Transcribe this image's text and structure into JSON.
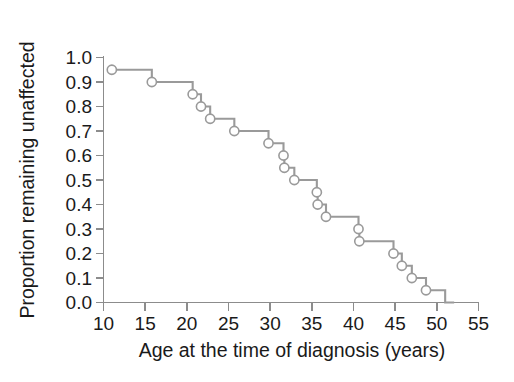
{
  "chart_data": {
    "type": "line",
    "subtype": "kaplan-meier-step",
    "title": "",
    "xlabel": "Age at the time of diagnosis (years)",
    "ylabel": "Proportion remaining unaffected",
    "xlim": [
      10,
      55
    ],
    "ylim": [
      0.0,
      1.0
    ],
    "grid": false,
    "legend": null,
    "xticks": [
      10,
      15,
      20,
      25,
      30,
      35,
      40,
      45,
      50,
      55
    ],
    "xtick_labels": [
      "10",
      "15",
      "20",
      "25",
      "30",
      "35",
      "40",
      "45",
      "50",
      "55"
    ],
    "yticks": [
      0.0,
      0.1,
      0.2,
      0.3,
      0.4,
      0.5,
      0.6,
      0.7,
      0.8,
      0.9,
      1.0
    ],
    "ytick_labels": [
      "0.0",
      "0.1",
      "0.2",
      "0.3",
      "0.4",
      "0.5",
      "0.6",
      "0.7",
      "0.8",
      "0.9",
      "1.0"
    ],
    "series": [
      {
        "name": "Proportion remaining unaffected",
        "color": "#9a9a9a",
        "marker": "open-circle",
        "marker_color": "#9a9a9a",
        "points": [
          {
            "x": 11.0,
            "y": 0.95
          },
          {
            "x": 15.8,
            "y": 0.9
          },
          {
            "x": 20.7,
            "y": 0.85
          },
          {
            "x": 21.7,
            "y": 0.8
          },
          {
            "x": 22.8,
            "y": 0.75
          },
          {
            "x": 25.7,
            "y": 0.7
          },
          {
            "x": 29.8,
            "y": 0.65
          },
          {
            "x": 31.6,
            "y": 0.6
          },
          {
            "x": 31.7,
            "y": 0.55
          },
          {
            "x": 32.9,
            "y": 0.5
          },
          {
            "x": 35.6,
            "y": 0.45
          },
          {
            "x": 35.7,
            "y": 0.4
          },
          {
            "x": 36.7,
            "y": 0.35
          },
          {
            "x": 40.6,
            "y": 0.3
          },
          {
            "x": 40.7,
            "y": 0.25
          },
          {
            "x": 44.8,
            "y": 0.2
          },
          {
            "x": 45.8,
            "y": 0.15
          },
          {
            "x": 47.0,
            "y": 0.1
          },
          {
            "x": 48.7,
            "y": 0.05
          },
          {
            "x": 51.0,
            "y": 0.0
          }
        ]
      }
    ],
    "colors": {
      "line": "#9a9a9a",
      "axis": "#8c8c8c",
      "text": "#1a1a1a",
      "background": "#ffffff",
      "marker_fill": "#ffffff"
    }
  }
}
